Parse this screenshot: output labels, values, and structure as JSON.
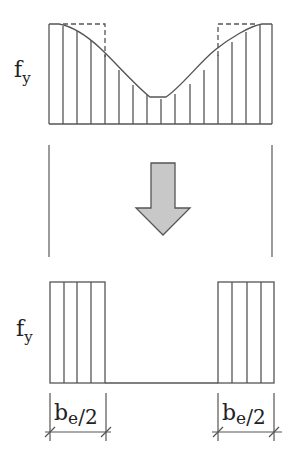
{
  "diagram": {
    "top_panel": {
      "stress_label_main": "f",
      "stress_label_sub": "y",
      "description": "Non-uniform stress distribution across plate width with dashed equivalent rectangular blocks"
    },
    "arrow": {
      "direction": "down",
      "fill": "#c8c8c8",
      "stroke": "#555555"
    },
    "bottom_panel": {
      "stress_label_main": "f",
      "stress_label_sub": "y",
      "left_dimension": {
        "main": "b",
        "sub": "e",
        "suffix": "/2"
      },
      "right_dimension": {
        "main": "b",
        "sub": "e",
        "suffix": "/2"
      }
    },
    "colors": {
      "line": "#555555",
      "background": "#ffffff"
    }
  }
}
